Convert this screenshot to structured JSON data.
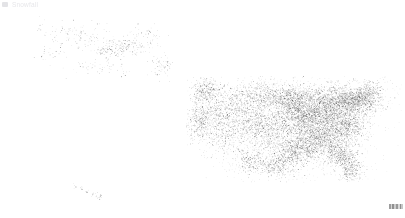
{
  "title": "Snowfall",
  "legend": {
    "swatch_icon": "legend-swatch-icon",
    "swatch_color": "#e3e3e6"
  },
  "canvas": {
    "width": 405,
    "height": 218,
    "background": "#ffffff",
    "dot_color": "#4a4a4a"
  },
  "corner_mark": {
    "name": "scale-bar",
    "label": ""
  },
  "chart_data": {
    "type": "scatter",
    "title": "Snowfall",
    "xlabel": "",
    "ylabel": "",
    "xlim": [
      0,
      405
    ],
    "ylim": [
      0,
      218
    ],
    "grid": false,
    "legend_position": "top-left",
    "projection": "albers-usa",
    "regions": [
      {
        "name": "Alaska",
        "bbox": [
          33,
          14,
          188,
          86
        ],
        "density": "sparse",
        "dot_count": 430,
        "clusters": [
          {
            "cx": 126,
            "cy": 46,
            "rx": 26,
            "ry": 9,
            "weight": 0.3
          },
          {
            "cx": 108,
            "cy": 52,
            "rx": 14,
            "ry": 8,
            "weight": 0.14
          },
          {
            "cx": 160,
            "cy": 66,
            "rx": 12,
            "ry": 10,
            "weight": 0.12
          },
          {
            "cx": 86,
            "cy": 38,
            "rx": 26,
            "ry": 13,
            "weight": 0.14
          },
          {
            "cx": 60,
            "cy": 33,
            "rx": 20,
            "ry": 11,
            "weight": 0.09
          },
          {
            "cx": 100,
            "cy": 68,
            "rx": 28,
            "ry": 10,
            "weight": 0.1
          },
          {
            "cx": 146,
            "cy": 33,
            "rx": 16,
            "ry": 8,
            "weight": 0.07
          },
          {
            "cx": 45,
            "cy": 56,
            "rx": 14,
            "ry": 9,
            "weight": 0.04
          }
        ]
      },
      {
        "name": "Continental United States",
        "bbox": [
          186,
          76,
          402,
          182
        ],
        "density": "variable",
        "dot_count": 9200,
        "clusters": [
          {
            "cx": 330,
            "cy": 104,
            "rx": 34,
            "ry": 18,
            "weight": 0.145
          },
          {
            "cx": 306,
            "cy": 118,
            "rx": 28,
            "ry": 20,
            "weight": 0.12
          },
          {
            "cx": 356,
            "cy": 100,
            "rx": 22,
            "ry": 13,
            "weight": 0.085
          },
          {
            "cx": 318,
            "cy": 138,
            "rx": 26,
            "ry": 17,
            "weight": 0.095
          },
          {
            "cx": 290,
            "cy": 100,
            "rx": 22,
            "ry": 16,
            "weight": 0.075
          },
          {
            "cx": 344,
            "cy": 126,
            "rx": 22,
            "ry": 16,
            "weight": 0.08
          },
          {
            "cx": 296,
            "cy": 150,
            "rx": 26,
            "ry": 15,
            "weight": 0.07
          },
          {
            "cx": 268,
            "cy": 128,
            "rx": 22,
            "ry": 20,
            "weight": 0.055
          },
          {
            "cx": 340,
            "cy": 154,
            "rx": 16,
            "ry": 13,
            "weight": 0.045
          },
          {
            "cx": 262,
            "cy": 96,
            "rx": 24,
            "ry": 16,
            "weight": 0.045
          },
          {
            "cx": 234,
            "cy": 104,
            "rx": 24,
            "ry": 20,
            "weight": 0.035
          },
          {
            "cx": 206,
            "cy": 92,
            "rx": 16,
            "ry": 13,
            "weight": 0.035
          },
          {
            "cx": 200,
            "cy": 122,
            "rx": 14,
            "ry": 16,
            "weight": 0.03
          },
          {
            "cx": 224,
            "cy": 136,
            "rx": 22,
            "ry": 16,
            "weight": 0.025
          },
          {
            "cx": 276,
            "cy": 166,
            "rx": 20,
            "ry": 11,
            "weight": 0.028
          },
          {
            "cx": 370,
            "cy": 92,
            "rx": 14,
            "ry": 10,
            "weight": 0.022
          },
          {
            "cx": 250,
            "cy": 160,
            "rx": 18,
            "ry": 12,
            "weight": 0.02
          },
          {
            "cx": 350,
            "cy": 170,
            "rx": 10,
            "ry": 14,
            "weight": 0.025
          },
          {
            "cx": 216,
            "cy": 116,
            "rx": 18,
            "ry": 14,
            "weight": 0.02
          },
          {
            "cx": 246,
            "cy": 120,
            "rx": 20,
            "ry": 18,
            "weight": 0.026
          }
        ]
      },
      {
        "name": "Hawaii",
        "bbox": [
          66,
          182,
          116,
          202
        ],
        "density": "very-sparse",
        "dot_count": 34,
        "clusters": [
          {
            "cx": 74,
            "cy": 186,
            "rx": 3,
            "ry": 2,
            "weight": 0.12
          },
          {
            "cx": 82,
            "cy": 189,
            "rx": 3,
            "ry": 2,
            "weight": 0.16
          },
          {
            "cx": 88,
            "cy": 191,
            "rx": 3,
            "ry": 2,
            "weight": 0.16
          },
          {
            "cx": 94,
            "cy": 193,
            "rx": 3,
            "ry": 2,
            "weight": 0.18
          },
          {
            "cx": 99,
            "cy": 196,
            "rx": 4,
            "ry": 3,
            "weight": 0.38
          }
        ]
      }
    ]
  }
}
